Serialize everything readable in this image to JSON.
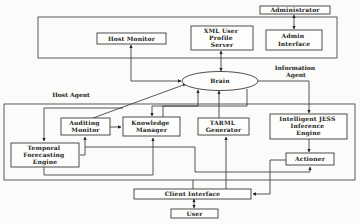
{
  "diagram": {
    "groups": {
      "information_agent": [
        "Information",
        "Agent"
      ],
      "host_agent": "Host Agent"
    },
    "nodes": {
      "administrator": [
        "Administrator"
      ],
      "host_monitor": [
        "Host Monitor"
      ],
      "xml_user_profile_server": [
        "XML User",
        "Profile",
        "Server"
      ],
      "admin_interface": [
        "Admin",
        "Interface"
      ],
      "brain": [
        "Brain"
      ],
      "auditing_monitor": [
        "Auditing",
        "Monitor"
      ],
      "knowledge_manager": [
        "Knowledge",
        "Manager"
      ],
      "temporal_forecasting_engine": [
        "Temporal",
        "Forecasting",
        "Engine"
      ],
      "tarml_generator": [
        "TARML",
        "Generator"
      ],
      "intelligent_jess_inference_engine": [
        "Intelligent JESS",
        "Inference",
        "Engine"
      ],
      "actioner": [
        "Actioner"
      ],
      "client_interface": [
        "Client Interface"
      ],
      "user": [
        "User"
      ]
    },
    "edges": [
      {
        "from": "Administrator",
        "to": "Admin Interface",
        "type": "bidirectional"
      },
      {
        "from": "Host Monitor",
        "to": "Brain",
        "type": "bidirectional"
      },
      {
        "from": "XML User Profile Server",
        "to": "Brain",
        "type": "bidirectional"
      },
      {
        "from": "Brain",
        "to": "Intelligent JESS Inference Engine",
        "type": "directed"
      },
      {
        "from": "Auditing Monitor",
        "to": "Brain",
        "type": "directed"
      },
      {
        "from": "Knowledge Manager",
        "to": "Brain",
        "type": "directed"
      },
      {
        "from": "TARML Generator",
        "to": "Brain",
        "type": "directed"
      },
      {
        "from": "Brain",
        "to": "Knowledge Manager",
        "type": "directed"
      },
      {
        "from": "Auditing Monitor",
        "to": "Knowledge Manager",
        "type": "directed"
      },
      {
        "from": "Knowledge Manager",
        "to": "Temporal Forecasting Engine",
        "type": "directed"
      },
      {
        "from": "Temporal Forecasting Engine",
        "to": "Knowledge Manager",
        "type": "directed"
      },
      {
        "from": "Client Interface",
        "to": "Auditing Monitor",
        "type": "directed"
      },
      {
        "from": "Client Interface",
        "to": "TARML Generator",
        "type": "directed"
      },
      {
        "from": "Intelligent JESS Inference Engine",
        "to": "Actioner",
        "type": "directed"
      },
      {
        "from": "Temporal Forecasting Engine",
        "to": "Actioner",
        "type": "directed"
      },
      {
        "from": "Actioner",
        "to": "Client Interface",
        "type": "directed"
      },
      {
        "from": "Client Interface",
        "to": "User",
        "type": "bidirectional"
      }
    ]
  }
}
